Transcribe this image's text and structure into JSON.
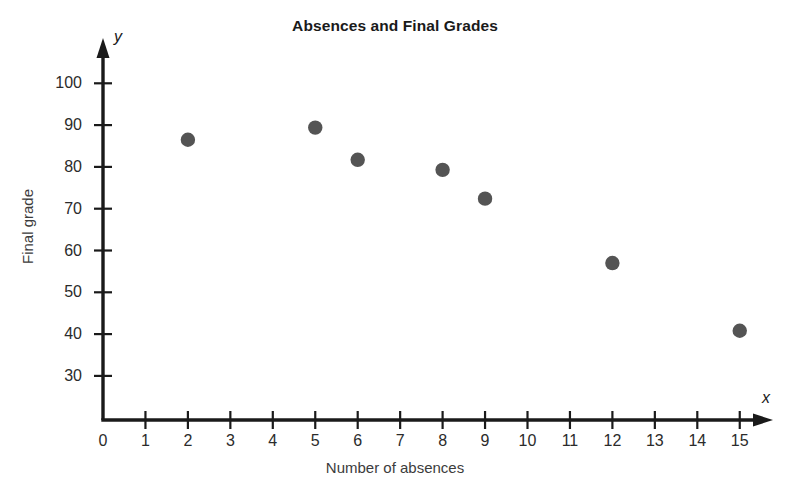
{
  "chart_data": {
    "type": "scatter",
    "title": "Absences and Final Grades",
    "xlabel": "Number of absences",
    "ylabel": "Final grade",
    "x_axis_letter": "x",
    "y_axis_letter": "y",
    "xlim": [
      0,
      15.6
    ],
    "ylim": [
      25,
      104
    ],
    "grid": false,
    "legend": "none",
    "marker_color": "#545454",
    "axis_color": "#1a1a1a",
    "x_ticks": [
      0,
      1,
      2,
      3,
      4,
      5,
      6,
      7,
      8,
      9,
      10,
      11,
      12,
      13,
      14,
      15
    ],
    "x_tick_labels": [
      "0",
      "1",
      "2",
      "3",
      "4",
      "5",
      "6",
      "7",
      "8",
      "9",
      "10",
      "11",
      "12",
      "13",
      "14",
      "15"
    ],
    "y_ticks": [
      30,
      40,
      50,
      60,
      70,
      80,
      90,
      100
    ],
    "y_tick_labels": [
      "30",
      "40",
      "50",
      "60",
      "70",
      "80",
      "90",
      "100"
    ],
    "x": [
      2,
      5,
      6,
      8,
      9,
      12,
      15
    ],
    "y": [
      86.5,
      89.4,
      81.7,
      79.3,
      72.4,
      57,
      40.8
    ],
    "points": [
      {
        "x": 2,
        "y": 86.5
      },
      {
        "x": 5,
        "y": 89.4
      },
      {
        "x": 6,
        "y": 81.7
      },
      {
        "x": 8,
        "y": 79.3
      },
      {
        "x": 9,
        "y": 72.4
      },
      {
        "x": 12,
        "y": 57
      },
      {
        "x": 15,
        "y": 40.8
      }
    ]
  }
}
